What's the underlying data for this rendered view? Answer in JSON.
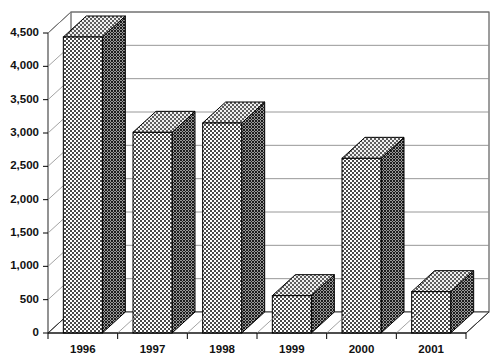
{
  "chart_data": {
    "type": "bar",
    "title": "",
    "subtitle": "",
    "xlabel": "",
    "ylabel": "",
    "categories": [
      "1996",
      "1997",
      "1998",
      "1999",
      "2000",
      "2001"
    ],
    "values": [
      4440,
      3010,
      3150,
      560,
      2620,
      620
    ],
    "series": [
      {
        "name": "",
        "values": [
          4440,
          3010,
          3150,
          560,
          2620,
          620
        ]
      }
    ],
    "ylim": [
      0,
      4500
    ],
    "ytick_values": [
      0,
      500,
      1000,
      1500,
      2000,
      2500,
      3000,
      3500,
      4000,
      4500
    ],
    "ytick_labels": [
      "0",
      "500",
      "1,000",
      "1,500",
      "2,000",
      "2,500",
      "3,000",
      "3,500",
      "4,000",
      "4,500"
    ],
    "grid": true,
    "grid_axis": "y",
    "legend": false,
    "legend_position": "none",
    "style": "3d-column",
    "annotations": [],
    "colors": {
      "bar_front": "#d9d9d9",
      "bar_side": "#6f6f6f",
      "bar_top": "#c4c4c4",
      "bar_outline": "#000000",
      "gridline": "#8c8c8c",
      "axis": "#000000",
      "background": "#ffffff",
      "text": "#111111"
    }
  }
}
